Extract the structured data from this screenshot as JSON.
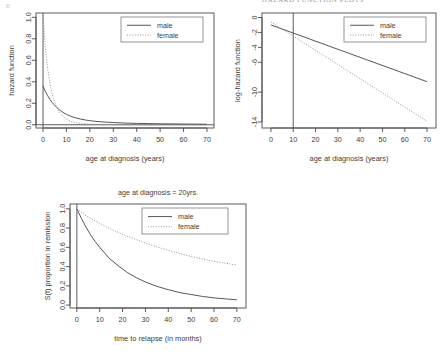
{
  "page": {
    "cut_header_text": "HAZARD FUNCTION PLOTS",
    "corner_mark": "e"
  },
  "legend": {
    "male_label": "male",
    "female_label": "female",
    "male_style": "solid",
    "female_style": "dotted",
    "male_color": "#4d4d4d",
    "female_color": "#8c8c8c"
  },
  "chart_data": [
    {
      "id": "hazard-function",
      "type": "line",
      "title": "",
      "xlabel": "age at diagnosis (years)",
      "ylabel": "hazard function",
      "xlim": [
        -3,
        73
      ],
      "ylim": [
        -0.03,
        1.04
      ],
      "xticks": [
        0,
        10,
        20,
        30,
        40,
        50,
        60,
        70
      ],
      "xticklabels": [
        "0",
        "10",
        "20",
        "30",
        "40",
        "50",
        "60",
        "70"
      ],
      "yticks": [
        0.0,
        0.2,
        0.4,
        0.6,
        0.8,
        1.0
      ],
      "yticklabels": [
        "0.0",
        "0.2",
        "0.4",
        "0.6",
        "0.8",
        "1.0"
      ],
      "grid": false,
      "legend_position": "top-right",
      "reference_lines": [
        {
          "orientation": "vertical",
          "value": 0
        },
        {
          "orientation": "horizontal",
          "value": 0
        }
      ],
      "x": [
        0,
        1,
        2,
        3,
        4,
        5,
        6,
        7,
        8,
        9,
        10,
        12,
        14,
        16,
        18,
        20,
        22,
        25,
        28,
        30,
        35,
        40,
        45,
        50,
        55,
        60,
        65,
        70
      ],
      "series": [
        {
          "name": "male",
          "style": "solid",
          "values": [
            0.36,
            0.31,
            0.27,
            0.235,
            0.205,
            0.18,
            0.158,
            0.139,
            0.123,
            0.109,
            0.097,
            0.078,
            0.064,
            0.053,
            0.045,
            0.038,
            0.033,
            0.027,
            0.023,
            0.021,
            0.016,
            0.013,
            0.011,
            0.009,
            0.008,
            0.007,
            0.006,
            0.005
          ]
        },
        {
          "name": "female",
          "style": "dotted",
          "values": [
            1.02,
            0.72,
            0.52,
            0.38,
            0.28,
            0.21,
            0.156,
            0.118,
            0.089,
            0.068,
            0.052,
            0.031,
            0.019,
            0.012,
            0.008,
            0.005,
            0.004,
            0.002,
            0.002,
            0.001,
            0.001,
            0.001,
            0.0,
            0.0,
            0.0,
            0.0,
            0.0,
            0.0
          ]
        }
      ]
    },
    {
      "id": "log-hazard-function",
      "type": "line",
      "title": "",
      "xlabel": "age at diagnosis (years)",
      "ylabel": "log-hazard function",
      "xlim": [
        -4,
        74
      ],
      "ylim": [
        -14.8,
        0.6
      ],
      "xticks": [
        0,
        10,
        20,
        30,
        40,
        50,
        60,
        70
      ],
      "xticklabels": [
        "0",
        "10",
        "20",
        "30",
        "40",
        "50",
        "60",
        "70"
      ],
      "yticks": [
        0,
        -2,
        -4,
        -6,
        -10,
        -14
      ],
      "yticklabels": [
        "0",
        "-2",
        "-4",
        "-6",
        "-10",
        "-14"
      ],
      "grid": false,
      "legend_position": "top-right",
      "reference_lines": [
        {
          "orientation": "vertical",
          "value": 10
        }
      ],
      "x": [
        0,
        70
      ],
      "series": [
        {
          "name": "male",
          "style": "solid",
          "values": [
            -1.0,
            -8.6
          ]
        },
        {
          "name": "female",
          "style": "dotted",
          "values": [
            -0.6,
            -13.9
          ]
        }
      ]
    },
    {
      "id": "survival-function",
      "type": "line",
      "title": "age at diagnosis = 20yrs.",
      "xlabel": "time to relapse (in months)",
      "ylabel": "S(t) proportion in remission",
      "xlim": [
        -3,
        74
      ],
      "ylim": [
        -0.03,
        1.05
      ],
      "xticks": [
        0,
        10,
        20,
        30,
        40,
        50,
        60,
        70
      ],
      "xticklabels": [
        "0",
        "10",
        "20",
        "30",
        "40",
        "50",
        "60",
        "70"
      ],
      "yticks": [
        0.0,
        0.2,
        0.4,
        0.6,
        0.8,
        1.0
      ],
      "yticklabels": [
        "0.0",
        "0.2",
        "0.4",
        "0.6",
        "0.8",
        "1.0"
      ],
      "grid": false,
      "legend_position": "top-right",
      "reference_lines": [
        {
          "orientation": "vertical",
          "value": 0
        }
      ],
      "x": [
        0,
        2,
        4,
        6,
        8,
        10,
        14,
        18,
        22,
        26,
        30,
        35,
        40,
        45,
        50,
        55,
        60,
        65,
        70
      ],
      "series": [
        {
          "name": "male",
          "style": "solid",
          "values": [
            1.0,
            0.9,
            0.81,
            0.73,
            0.66,
            0.6,
            0.49,
            0.41,
            0.34,
            0.285,
            0.24,
            0.195,
            0.16,
            0.13,
            0.11,
            0.09,
            0.075,
            0.065,
            0.055
          ]
        },
        {
          "name": "female",
          "style": "dotted",
          "values": [
            1.0,
            0.965,
            0.93,
            0.9,
            0.875,
            0.85,
            0.8,
            0.755,
            0.715,
            0.68,
            0.645,
            0.605,
            0.57,
            0.535,
            0.505,
            0.48,
            0.455,
            0.435,
            0.415
          ]
        }
      ]
    }
  ]
}
